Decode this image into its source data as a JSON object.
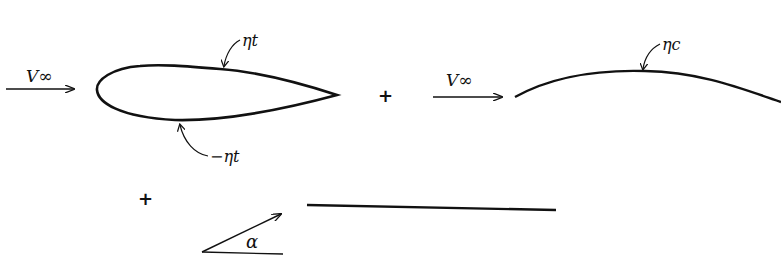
{
  "diagram": {
    "panels": {
      "thickness": {
        "freestream_label": "V∞",
        "upper_label": "ηt",
        "lower_label": "−ηt"
      },
      "camber": {
        "freestream_label": "V∞",
        "camber_label": "ηc"
      },
      "incidence": {
        "angle_label": "α"
      }
    },
    "operators": [
      "+",
      "+"
    ],
    "colors": {
      "ink": "#111111",
      "background": "#ffffff"
    }
  }
}
